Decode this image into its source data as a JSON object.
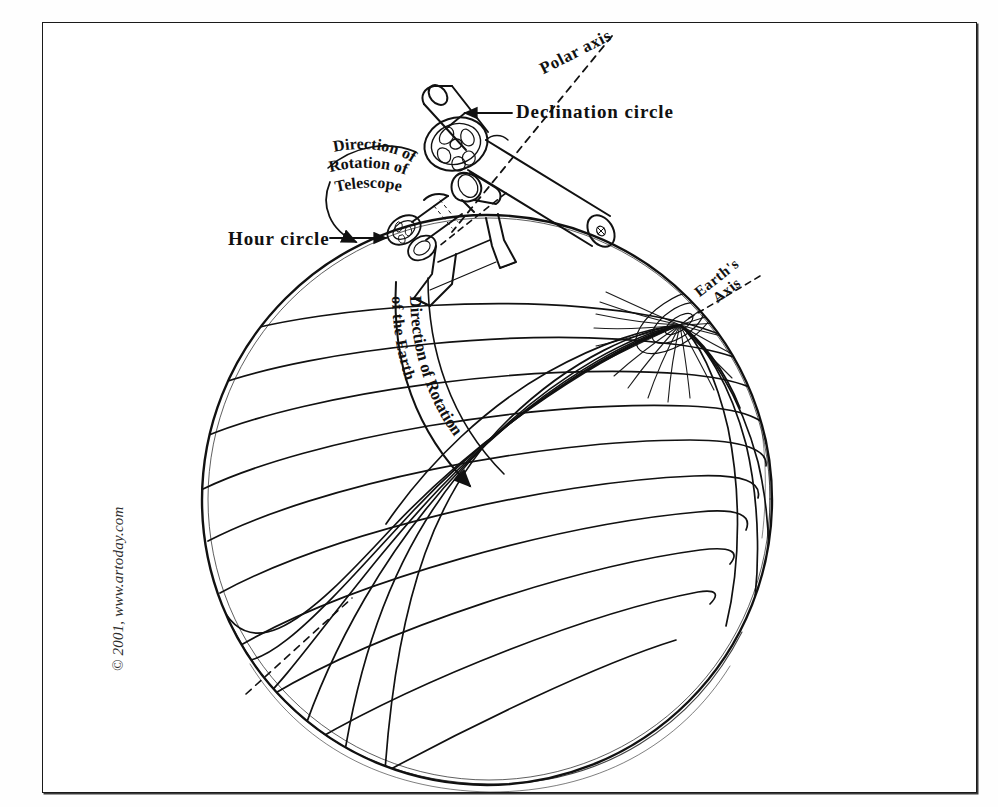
{
  "image": {
    "title": "Equatorial telescope mounted on the Earth",
    "type": "line-art-diagram",
    "background_color": "#ffffff",
    "ink_color": "#111111",
    "frame": {
      "border_color": "#1a1a1a",
      "shadow_color": "#3a3a3a"
    }
  },
  "credit": {
    "text": "© 2001, www.artoday.com"
  },
  "labels": {
    "polar_axis": "Polar axis",
    "declination_circle": "Declination circle",
    "hour_circle": "Hour circle",
    "earths_axis_line1": "Earth's",
    "earths_axis_line2": "Axis",
    "direction_rotation_telescope_line1": "Direction of",
    "direction_rotation_telescope_line2": "Rotation of",
    "direction_rotation_telescope_line3": "Telescope",
    "direction_rotation_earth_line1": "Direction of Rotation",
    "direction_rotation_earth_line2": "of the Earth"
  },
  "diagram_parts": [
    "globe",
    "latitude-lines",
    "longitude-lines",
    "north-pole",
    "telescope-tube",
    "declination-circle-wheel",
    "hour-circle-wheel",
    "counterweight-arm",
    "mount-pier",
    "polar-axis-dashed-line",
    "earths-axis-dashed-line",
    "rotation-arrow-earth",
    "rotation-arrow-telescope",
    "leader-line-declination",
    "leader-line-hour-circle",
    "lower-left-dashed-line"
  ]
}
